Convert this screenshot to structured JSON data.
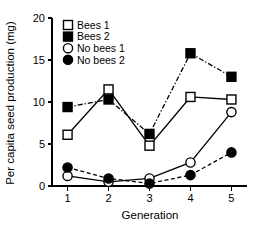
{
  "chart_data": {
    "type": "line",
    "title": "",
    "xlabel": "Generation",
    "ylabel": "Per capita seed production (mg)",
    "x": [
      1,
      2,
      3,
      4,
      5
    ],
    "xtick_labels": [
      "1",
      "2",
      "3",
      "4",
      "5"
    ],
    "ytick_labels": [
      "0",
      "5",
      "10",
      "15",
      "20"
    ],
    "yticks": [
      0,
      5,
      10,
      15,
      20
    ],
    "xlim": [
      0.62,
      5.38
    ],
    "ylim": [
      0,
      20
    ],
    "grid": false,
    "legend_position": "top-left",
    "series": [
      {
        "name": "Bees 1",
        "values": [
          6.1,
          11.5,
          4.8,
          10.6,
          10.3
        ],
        "marker": "open-square",
        "line_style": "solid",
        "color": "#000000"
      },
      {
        "name": "Bees 2",
        "values": [
          9.4,
          10.3,
          6.2,
          15.8,
          13.0
        ],
        "marker": "filled-square",
        "line_style": "dash-dot",
        "color": "#000000"
      },
      {
        "name": "No bees 1",
        "values": [
          1.2,
          0.5,
          0.9,
          2.8,
          8.8
        ],
        "marker": "open-circle",
        "line_style": "solid",
        "color": "#000000"
      },
      {
        "name": "No bees 2",
        "values": [
          2.2,
          0.9,
          0.3,
          1.3,
          4.0
        ],
        "marker": "filled-circle",
        "line_style": "dashed",
        "color": "#000000"
      }
    ]
  }
}
